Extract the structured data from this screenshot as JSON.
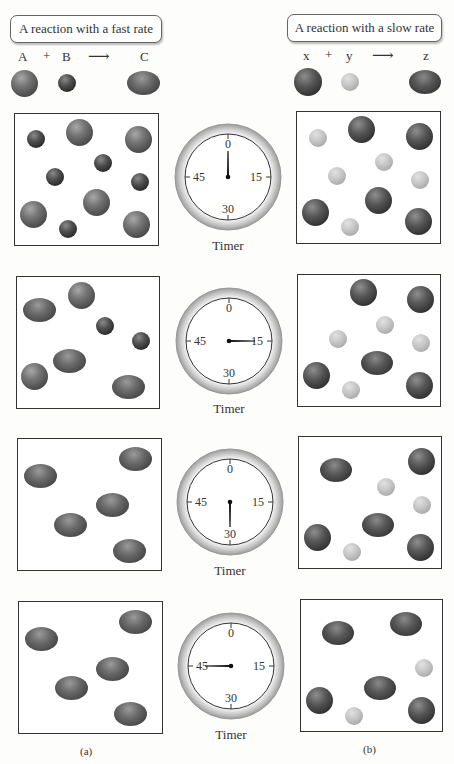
{
  "left": {
    "title": "A reaction with a fast rate",
    "equation": {
      "reactant1": "A",
      "plus": "+",
      "reactant2": "B",
      "arrow": "⟶",
      "product": "C"
    },
    "caption": "(a)"
  },
  "right": {
    "title": "A reaction with a slow rate",
    "equation": {
      "reactant1": "x",
      "plus": "+",
      "reactant2": "y",
      "arrow": "⟶",
      "product": "z"
    },
    "caption": "(b)"
  },
  "timer": {
    "label": "Timer",
    "ticks": {
      "top": "0",
      "right": "15",
      "bottom": "30",
      "left": "45"
    },
    "states": [
      {
        "hand_position": "0"
      },
      {
        "hand_position": "15"
      },
      {
        "hand_position": "30"
      },
      {
        "hand_position": "45"
      }
    ]
  },
  "rows": [
    {
      "left_contents": {
        "A": 5,
        "B": 5,
        "C": 0
      },
      "right_contents": {
        "x": 5,
        "y": 5,
        "z": 0
      }
    },
    {
      "left_contents": {
        "A": 2,
        "B": 2,
        "C": 3
      },
      "right_contents": {
        "x": 4,
        "y": 4,
        "z": 1
      }
    },
    {
      "left_contents": {
        "A": 0,
        "B": 0,
        "C": 5
      },
      "right_contents": {
        "x": 3,
        "y": 3,
        "z": 2
      }
    },
    {
      "left_contents": {
        "A": 0,
        "B": 0,
        "C": 5
      },
      "right_contents": {
        "x": 2,
        "y": 2,
        "z": 3
      }
    }
  ]
}
